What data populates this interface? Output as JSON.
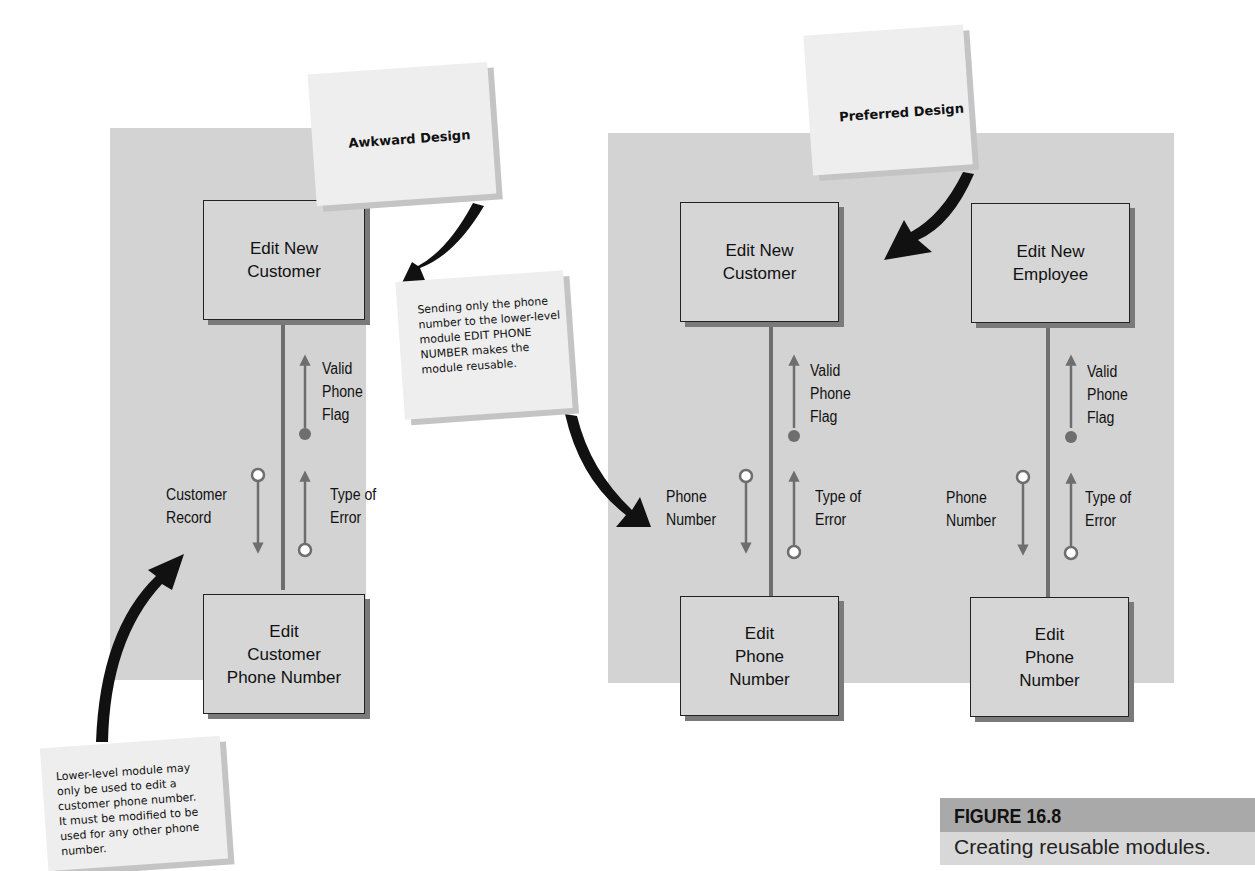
{
  "figure": {
    "number": "FIGURE 16.8",
    "caption": "Creating reusable modules."
  },
  "awkward_design": {
    "title": "Awkward Design",
    "top_module": "Edit New\nCustomer",
    "bottom_module": "Edit\nCustomer\nPhone Number",
    "up_flag_label": "Valid\nPhone\nFlag",
    "down_data_label": "Customer\nRecord",
    "up_data_label": "Type of\nError",
    "note": "Lower-level module may\nonly be used to edit a\ncustomer phone number.\nIt must be modified to be\nused for any other phone\nnumber."
  },
  "preferred_design": {
    "title": "Preferred Design",
    "note": "Sending only the phone\nnumber to the lower-level\nmodule EDIT PHONE\nNUMBER makes the\nmodule reusable.",
    "structures": [
      {
        "top_module": "Edit New\nCustomer",
        "bottom_module": "Edit\nPhone\nNumber",
        "up_flag_label": "Valid\nPhone\nFlag",
        "down_data_label": "Phone\nNumber",
        "up_data_label": "Type of\nError"
      },
      {
        "top_module": "Edit New\nEmployee",
        "bottom_module": "Edit\nPhone\nNumber",
        "up_flag_label": "Valid\nPhone\nFlag",
        "down_data_label": "Phone\nNumber",
        "up_data_label": "Type of\nError"
      }
    ]
  },
  "colors": {
    "panel": "#d3d3d3",
    "module_fill": "#d6d6d6",
    "connector": "#6e6e6e",
    "callout_arrow": "#111111",
    "note": "#eeeeee",
    "caption_head": "#a9a9a9"
  }
}
